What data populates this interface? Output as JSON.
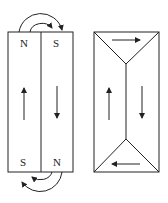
{
  "figure": {
    "left_panel": {
      "description": "U-shaped magnetic circuit: two parallel bars with return flux paths",
      "top_labels": [
        "N",
        "S"
      ],
      "bottom_labels": [
        "S",
        "N"
      ],
      "left_bar_flux": "up",
      "right_bar_flux": "down"
    },
    "right_panel": {
      "description": "Closed flux domain structure with triangular closure domains",
      "top_domain_flux": "right",
      "bottom_domain_flux": "left",
      "left_domain_flux": "up",
      "right_domain_flux": "down"
    },
    "colors": {
      "line": "#222222",
      "background": "#ffffff"
    }
  }
}
